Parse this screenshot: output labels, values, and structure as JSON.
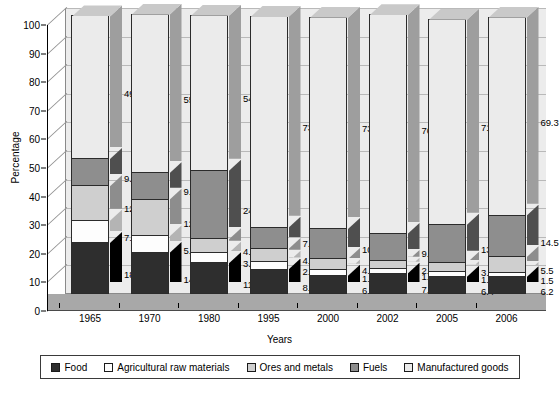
{
  "chart_data": {
    "type": "bar",
    "subtype": "stacked-column-3d",
    "title": "",
    "xlabel": "Years",
    "ylabel": "Percentage",
    "ylim": [
      0,
      100
    ],
    "ytick_step": 10,
    "yticks": [
      0,
      10,
      20,
      30,
      40,
      50,
      60,
      70,
      80,
      90,
      100
    ],
    "grid": true,
    "legend_position": "bottom",
    "categories": [
      "1965",
      "1970",
      "1980",
      "1995",
      "2000",
      "2002",
      "2005",
      "2006"
    ],
    "series": [
      {
        "name": "Food",
        "color": "#2e2e2e",
        "values": [
          18.2,
          14.7,
          11.1,
          8.9,
          6.7,
          7.4,
          6.4,
          6.2
        ]
      },
      {
        "name": "Agricultural raw materials",
        "color": "#fdfdfd",
        "values": [
          7.8,
          5.8,
          3.7,
          2.7,
          1.9,
          1.8,
          1.6,
          1.5
        ]
      },
      {
        "name": "Ores and metals",
        "color": "#cfcfcf",
        "values": [
          12.0,
          12.8,
          4.7,
          4.5,
          4.0,
          2.7,
          3.3,
          5.5
        ]
      },
      {
        "name": "Fuels",
        "color": "#8e8e8e",
        "values": [
          9.6,
          9.3,
          24.0,
          7.4,
          10.5,
          9.4,
          13.3,
          14.5
        ]
      },
      {
        "name": "Manufactured goods",
        "color": "#ebebeb",
        "values": [
          49.8,
          55.4,
          54.2,
          73.7,
          73.9,
          76.5,
          71.7,
          69.3
        ]
      }
    ]
  }
}
